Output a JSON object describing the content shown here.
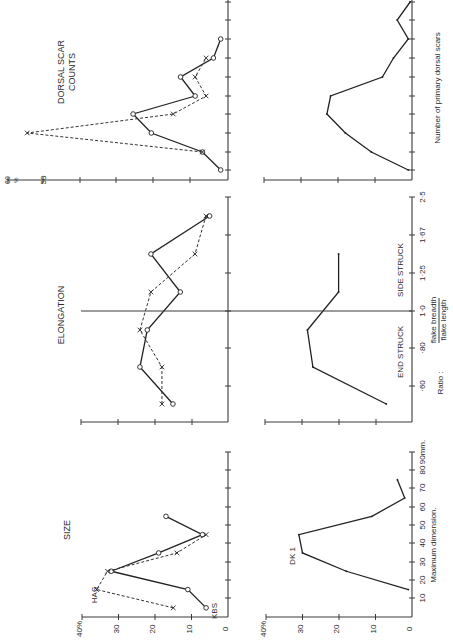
{
  "figure": {
    "orientation": "rotated 90 degrees counter-clockwise",
    "series_labels": {
      "solid": "KBS",
      "dashed": "HAS",
      "bottom": "DK 1"
    }
  },
  "chart_data": [
    {
      "id": "size_top",
      "type": "line",
      "title": "SIZE",
      "xlabel": "Maximum dimension",
      "ylabel": "%",
      "x": [
        5,
        15,
        25,
        35,
        45,
        55
      ],
      "x_ticks": [
        "10",
        "20",
        "30",
        "40",
        "50",
        "60",
        "70",
        "80",
        "90mm."
      ],
      "y_ticks": [
        "0",
        "10",
        "20",
        "30",
        "40%"
      ],
      "ylim": [
        0,
        40
      ],
      "series": [
        {
          "name": "KBS",
          "style": "solid",
          "marker": "circle",
          "values": [
            6,
            11,
            32,
            19,
            7,
            17
          ]
        },
        {
          "name": "HAS",
          "style": "dashed",
          "marker": "x",
          "values": [
            15,
            36,
            33,
            14,
            6,
            null
          ]
        }
      ],
      "annotations": [
        "HAS",
        "KBS"
      ]
    },
    {
      "id": "size_bottom",
      "type": "line",
      "title": "",
      "xlabel": "Maximum dimension.",
      "ylabel": "%",
      "x": [
        15,
        25,
        35,
        45,
        55,
        65,
        75
      ],
      "x_ticks": [
        "10",
        "20",
        "30",
        "40",
        "50",
        "60",
        "70",
        "80",
        "90mm."
      ],
      "y_ticks": [
        "0",
        "10",
        "20",
        "30",
        "40%"
      ],
      "ylim": [
        0,
        40
      ],
      "series": [
        {
          "name": "DK 1",
          "style": "solid",
          "marker": "dot",
          "values": [
            1,
            18,
            30,
            31,
            11,
            2,
            4
          ]
        }
      ],
      "annotations": [
        "DK 1"
      ]
    },
    {
      "id": "elongation_top",
      "type": "line",
      "title": "ELONGATION",
      "xlabel": "",
      "ylabel": "%",
      "x": [
        "<0.60",
        "0.60-0.80",
        "0.80-1.0",
        "1.0-1.25",
        "1.25-1.67",
        "1.67-2.5"
      ],
      "ylim": [
        0,
        40
      ],
      "divider_at": "1.0",
      "series": [
        {
          "name": "KBS",
          "style": "solid",
          "marker": "circle",
          "values": [
            15,
            24,
            22,
            13,
            21,
            5
          ]
        },
        {
          "name": "HAS",
          "style": "dashed",
          "marker": "x",
          "values": [
            18,
            18,
            24,
            21,
            9,
            6
          ]
        }
      ]
    },
    {
      "id": "elongation_bottom",
      "type": "line",
      "title": "",
      "xlabel": "Ratio : flake breadth / flake length",
      "ylabel": "%",
      "x": [
        "<0.60",
        "0.60-0.80",
        "0.80-1.0",
        "1.0-1.25",
        "1.25-1.67"
      ],
      "x_ticks": [
        "·60",
        "·80",
        "1·0",
        "1·25",
        "1·67",
        "2·5"
      ],
      "region_labels": [
        "END STRUCK",
        "SIDE STRUCK"
      ],
      "ylim": [
        0,
        40
      ],
      "divider_at": "1.0",
      "series": [
        {
          "name": "DK 1",
          "style": "solid",
          "marker": "dot",
          "values": [
            7,
            27,
            28.5,
            20,
            20
          ]
        }
      ]
    },
    {
      "id": "dorsal_top",
      "type": "line",
      "title": "DORSAL SCAR COUNTS",
      "xlabel": "",
      "ylabel": "%",
      "x": [
        0,
        1,
        2,
        3,
        4,
        5,
        6,
        7,
        8,
        9
      ],
      "y_ticks": [
        "0",
        "10",
        "20",
        "30",
        "40",
        "50",
        "60 %"
      ],
      "ylim": [
        0,
        60
      ],
      "series": [
        {
          "name": "KBS",
          "style": "solid",
          "marker": "circle",
          "values": [
            2,
            7,
            21,
            26,
            9,
            13,
            4,
            2,
            null,
            null
          ]
        },
        {
          "name": "HAS",
          "style": "dashed",
          "marker": "x",
          "values": [
            null,
            7,
            55,
            15,
            6,
            9,
            6,
            null,
            null,
            null
          ]
        }
      ]
    },
    {
      "id": "dorsal_bottom",
      "type": "line",
      "title": "",
      "xlabel": "Number of primary dorsal scars",
      "ylabel": "%",
      "x": [
        0,
        1,
        2,
        3,
        4,
        5,
        6,
        7,
        8,
        9
      ],
      "ylim": [
        0,
        40
      ],
      "series": [
        {
          "name": "DK 1",
          "style": "solid",
          "marker": "dot",
          "values": [
            1,
            11,
            18,
            23,
            22,
            8,
            5,
            1,
            4,
            0.5
          ]
        }
      ]
    }
  ],
  "labels": {
    "size_title": "SIZE",
    "elong_title": "ELONGATION",
    "dorsal_title_1": "DORSAL SCAR",
    "dorsal_title_2": "COUNTS",
    "has": "HAS",
    "kbs": "KBS",
    "dk1": "DK 1",
    "size_xlabel": "Maximum dimension.",
    "size_ticks": [
      "10",
      "20",
      "30",
      "40",
      "50",
      "60",
      "70",
      "80",
      "90mm."
    ],
    "pct_ticks_40": [
      "0",
      "10",
      "20",
      "30",
      "40%"
    ],
    "pct_top_dorsal": [
      "50",
      "60"
    ],
    "pct_sign": "%",
    "end_struck": "END STRUCK",
    "side_struck": "SIDE STRUCK",
    "elong_ticks": [
      "·60",
      "·80",
      "1·0",
      "1·25",
      "1·67",
      "2·5"
    ],
    "ratio": "Ratio :",
    "ratio_num": "flake breadth",
    "ratio_den": "flake length",
    "dorsal_xlabel": "Number of primary dorsal scars"
  }
}
